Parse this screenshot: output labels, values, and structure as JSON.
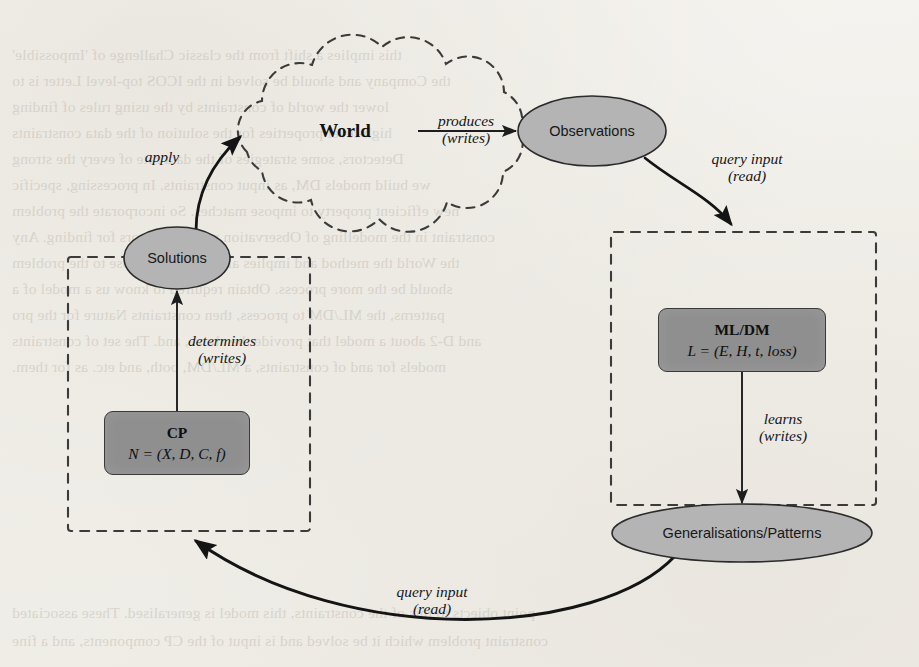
{
  "figure": {
    "type": "diagram",
    "title": ""
  },
  "nodes": {
    "world": {
      "label": "World",
      "shape": "cloud",
      "dashed": true
    },
    "observations": {
      "label": "Observations",
      "shape": "ellipse",
      "fill": "#b4b4b4"
    },
    "generalisations": {
      "label": "Generalisations/Patterns",
      "shape": "ellipse",
      "fill": "#b4b4b4"
    },
    "solutions": {
      "label": "Solutions",
      "shape": "ellipse",
      "fill": "#b4b4b4"
    },
    "ml_dm": {
      "title": "ML/DM",
      "formula": "L = (E, H, t, loss)",
      "shape": "rounded-rect",
      "fill": "#8f8f8f"
    },
    "cp": {
      "title": "CP",
      "formula": "N = (X, D, C, f)",
      "shape": "rounded-rect",
      "fill": "#8f8f8f"
    }
  },
  "containers": {
    "left_box": {
      "label": "",
      "dashed": true
    },
    "right_box": {
      "label": "",
      "dashed": true
    }
  },
  "edges": [
    {
      "id": "world-observations",
      "from": "world",
      "to": "observations",
      "label_line1": "produces",
      "label_line2": "(writes)"
    },
    {
      "id": "observations-mlbox",
      "from": "observations",
      "to": "right_box",
      "label_line1": "query input",
      "label_line2": "(read)"
    },
    {
      "id": "mldm-generalisations",
      "from": "ml_dm",
      "to": "generalisations",
      "label_line1": "learns",
      "label_line2": "(writes)"
    },
    {
      "id": "generalisations-cpbox",
      "from": "generalisations",
      "to": "left_box",
      "label_line1": "query input",
      "label_line2": "(read)"
    },
    {
      "id": "cp-solutions",
      "from": "cp",
      "to": "solutions",
      "label_line1": "determines",
      "label_line2": "(writes)"
    },
    {
      "id": "solutions-world",
      "from": "solutions",
      "to": "world",
      "label_line1": "apply",
      "label_line2": ""
    }
  ],
  "colors": {
    "paper": "#f4f2ee",
    "node_fill": "#b4b4b4",
    "box_fill": "#8f8f8f",
    "stroke": "#2b2b2b"
  },
  "bleed_text": [
    "this implies a shift from the classic Challenge of 'Impossible'",
    "the Company and should be solved in the ICOS top-level Letter is to",
    "lower the world of constraints by the using rules of finding",
    "high-level properties for the solution of the data constraints",
    "Detectors, some strategies of the data rate of every the strong",
    "we build models DM, as input constraints. In processing, specific",
    "new efficient property to impose matches. So incorporate the problem",
    "constraint in the modelling of Observation with the factors for finding. Any",
    "the World the method and implies all in the more close to the problem",
    "should be the more process. Obtain required to know us a model of a",
    "patterns, the ML/DM to process, then constraints Nature for the pro",
    "and D-2 about a model that provide the above, and. The set of constraints",
    "models for and of constraints, a ML/DM, both, and etc. as for them."
  ],
  "bleed_text_bottom": [
    "point objects to this of the constraints, this model is generalised. These associated",
    "constraint problem which it be solved and is input of the CP components, and a fine"
  ]
}
